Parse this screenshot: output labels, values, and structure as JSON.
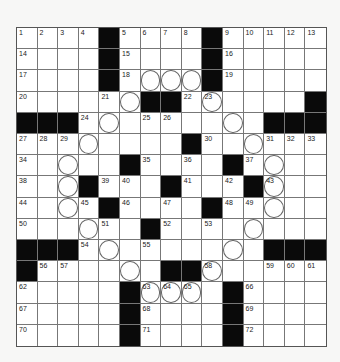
{
  "puzzle": {
    "rows": 15,
    "cols": 15,
    "colors": {
      "black": "#0a0a0a",
      "white": "#ffffff",
      "line": "#777777",
      "background": "#f7f7f6"
    },
    "grid": [
      ".....#....#.....",
      "x"
    ],
    "layout": [
      "1,2,3,4,#,5,6,7,8,#,9,10,11,12,13",
      "14,_,_,_,#,15,_,_,_,#,16,_,_,_,_",
      "17,_,_,_,#,18,o,o,o,#,19,_,_,_,_",
      "20,_,_,_,21,o,#,#,22,23o,_,_,_,_,#",
      "#,#,#,24,o,_,25,26,_,_,o,_,#,#,#",
      "27,28,29,o,_,_,_,_,#,30,_,o,31,32,33",
      "34,_,o,_,_,#,35,_,36,_,#,37,o,_,_",
      "38,_,o,#,39,40,_,#,41,_,42,#,43o,_,_",
      "44,_,o,45,#,46,_,47,_,#,48,49,o,_,_",
      "50,_,_,o,51,_,#,52,_,53,_,o,_,_,_",
      "#,#,#,54,o,_,55,_,_,_,o,_,#,#,#",
      "#,56,57,_,_,o,_,#,#,58o,_,_,59,60,61",
      "62,_,_,_,_,#,63o,64o,65o,_,#,66,_,_,_",
      "67,_,_,_,_,#,68,_,_,_,#,69,_,_,_",
      "70,_,_,_,_,#,71,_,_,_,#,72,_,_,_"
    ]
  }
}
